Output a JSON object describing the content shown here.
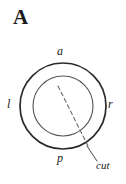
{
  "figure": {
    "panel_letter": "A",
    "background_color": "#ffffff",
    "stroke_color": "#2b2b2b",
    "inner_stroke_color": "#555555",
    "dash_color": "#6b6b6b",
    "width": 126,
    "height": 184
  },
  "labels": {
    "anterior": "a",
    "left": "l",
    "right": "r",
    "posterior": "p",
    "cut": "cut"
  },
  "geometry": {
    "outer_circle": {
      "cx": 63,
      "cy": 106,
      "r": 43
    },
    "inner_circle": {
      "cx": 63,
      "cy": 106,
      "r": 30
    },
    "cut_line": {
      "x1": 58,
      "y1": 86,
      "x2": 89,
      "y2": 148
    },
    "leader_line": {
      "x1": 87,
      "y1": 146,
      "x2": 97,
      "y2": 161
    }
  }
}
